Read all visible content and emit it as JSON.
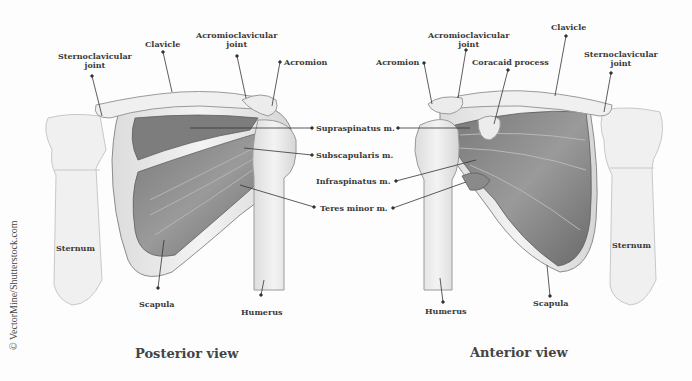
{
  "diagram": {
    "credit": "© VectorMine/Shutterstock.com",
    "colors": {
      "background": "#fdfdfd",
      "bone": "#ececec",
      "bone_outline": "#9a9a9a",
      "muscle_dark": "#6e6e6e",
      "muscle_mid": "#8a8a8a",
      "muscle_light": "#b4b4b4",
      "label_text": "#3a3a3a",
      "leader_line": "#333333"
    },
    "views": [
      {
        "title": "Posterior view",
        "labels": {
          "sternoclavicular": "Sternoclavicular joint",
          "sternoclavicular_l1": "Sternoclavicular",
          "sternoclavicular_l2": "joint",
          "clavicle": "Clavicle",
          "acromioclavicular_l1": "Acromioclavicular",
          "acromioclavicular_l2": "joint",
          "acromion": "Acromion",
          "sternum": "Sternum",
          "scapula": "Scapula",
          "humerus": "Humerus"
        }
      },
      {
        "title": "Anterior view",
        "labels": {
          "acromioclavicular_l1": "Acromioclavicular",
          "acromioclavicular_l2": "joint",
          "acromion": "Acromion",
          "coracoid": "Coracaid process",
          "clavicle": "Clavicle",
          "sternoclavicular_l1": "Sternoclavicular",
          "sternoclavicular_l2": "joint",
          "sternum": "Sternum",
          "scapula": "Scapula",
          "humerus": "Humerus"
        }
      }
    ],
    "muscles": [
      "Supraspinatus m.",
      "Subscapularis m.",
      "Infraspinatus m.",
      "Teres minor m."
    ]
  }
}
